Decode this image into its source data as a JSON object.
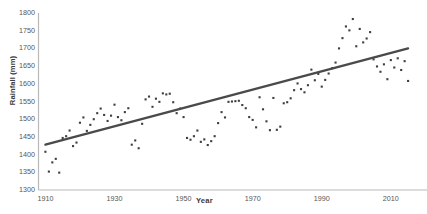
{
  "header": {
    "left_fragment": "",
    "right_fragment": ""
  },
  "chart_data": {
    "type": "scatter",
    "title": "",
    "xlabel": "Year",
    "ylabel": "Rainfall (mm)",
    "xlim": [
      1908,
      2017
    ],
    "ylim": [
      1300,
      1800
    ],
    "xticks": [
      1910,
      1930,
      1950,
      1970,
      1990,
      2010
    ],
    "yticks": [
      1300,
      1350,
      1400,
      1450,
      1500,
      1550,
      1600,
      1650,
      1700,
      1750,
      1800
    ],
    "grid": false,
    "legend": "none",
    "marker": "small-dark-square",
    "marker_color": "#3f3f3f",
    "trendline": {
      "type": "linear",
      "color": "#4a4a4a",
      "x": [
        1910,
        2015
      ],
      "y": [
        1428,
        1700
      ]
    },
    "series": [
      {
        "name": "Annual rainfall",
        "x": [
          1910,
          1911,
          1912,
          1913,
          1914,
          1915,
          1916,
          1917,
          1918,
          1919,
          1920,
          1921,
          1922,
          1923,
          1924,
          1925,
          1926,
          1927,
          1928,
          1929,
          1930,
          1931,
          1932,
          1933,
          1934,
          1935,
          1936,
          1937,
          1938,
          1939,
          1940,
          1941,
          1942,
          1943,
          1944,
          1945,
          1946,
          1947,
          1948,
          1949,
          1950,
          1951,
          1952,
          1953,
          1954,
          1955,
          1956,
          1957,
          1958,
          1959,
          1960,
          1961,
          1962,
          1963,
          1964,
          1965,
          1966,
          1967,
          1968,
          1969,
          1970,
          1971,
          1972,
          1973,
          1974,
          1975,
          1976,
          1977,
          1978,
          1979,
          1980,
          1981,
          1982,
          1983,
          1984,
          1985,
          1986,
          1987,
          1988,
          1989,
          1990,
          1991,
          1992,
          1993,
          1994,
          1995,
          1996,
          1997,
          1998,
          1999,
          2000,
          2001,
          2002,
          2003,
          2004,
          2005,
          2006,
          2007,
          2008,
          2009,
          2010,
          2011,
          2012,
          2013,
          2014,
          2015
        ],
        "y": [
          1408,
          1352,
          1378,
          1388,
          1349,
          1447,
          1452,
          1468,
          1424,
          1434,
          1490,
          1505,
          1467,
          1484,
          1500,
          1517,
          1530,
          1512,
          1495,
          1510,
          1541,
          1506,
          1497,
          1520,
          1531,
          1428,
          1440,
          1418,
          1487,
          1556,
          1564,
          1535,
          1558,
          1549,
          1573,
          1570,
          1572,
          1548,
          1517,
          1530,
          1506,
          1447,
          1442,
          1452,
          1468,
          1436,
          1443,
          1427,
          1438,
          1452,
          1489,
          1520,
          1505,
          1549,
          1550,
          1551,
          1552,
          1540,
          1531,
          1506,
          1498,
          1477,
          1562,
          1528,
          1494,
          1469,
          1560,
          1470,
          1479,
          1545,
          1548,
          1559,
          1582,
          1601,
          1585,
          1576,
          1596,
          1640,
          1610,
          1628,
          1592,
          1611,
          1629,
          1644,
          1660,
          1700,
          1729,
          1762,
          1751,
          1783,
          1706,
          1755,
          1717,
          1728,
          1746,
          1669,
          1649,
          1634,
          1655,
          1613,
          1667,
          1646,
          1672,
          1639,
          1664,
          1608
        ]
      }
    ]
  }
}
